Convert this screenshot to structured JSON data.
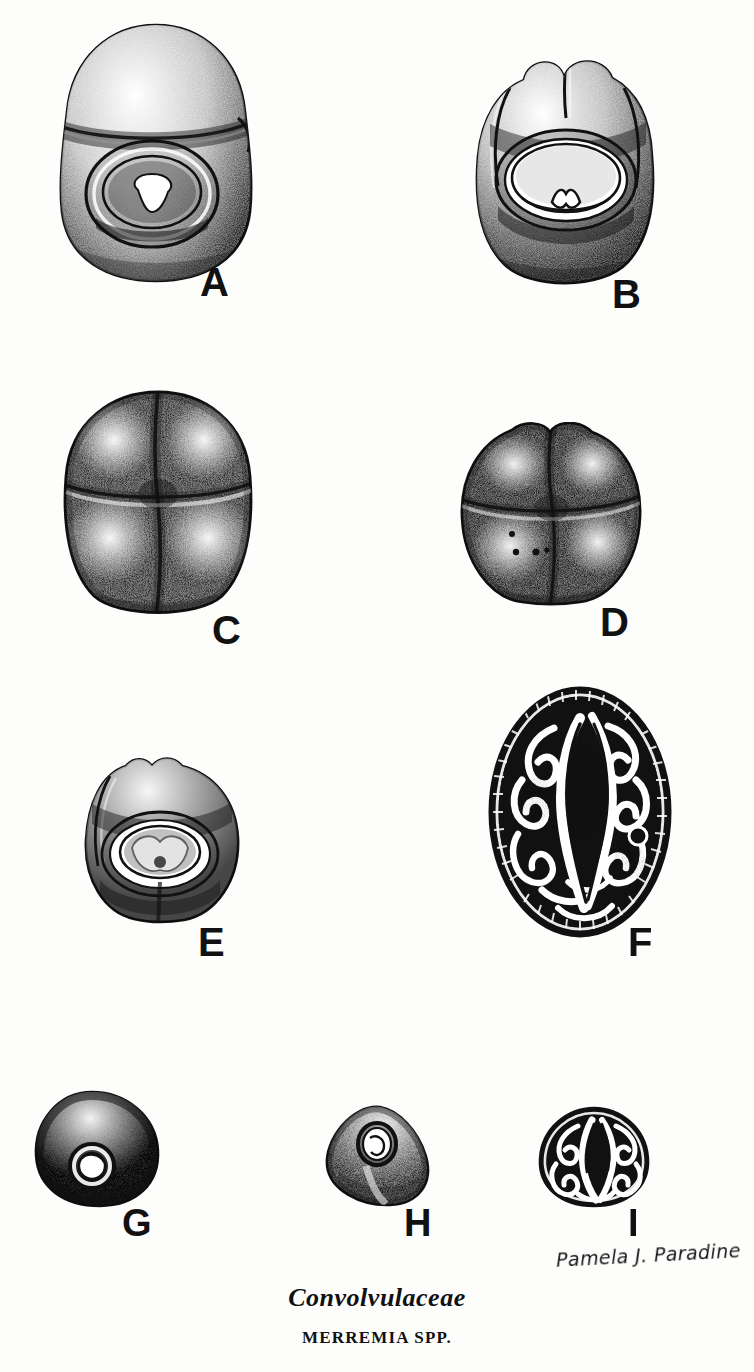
{
  "plate": {
    "title_family": "Convolvulaceae",
    "title_genus": "MERREMIA SPP.",
    "artist_signature": "Pamela J. Paradine",
    "ink_color": "#111111",
    "paper_color": "#fdfdfc",
    "figures": [
      {
        "letter": "A",
        "subject": "seed-hilar-view-large",
        "description": "Large ovoid seed, hilar (ventral) face showing broad oval hilum scar with concentric rim and pale central aperture; dense stipple shading",
        "x": 52,
        "y": 22,
        "w": 208,
        "h": 262,
        "label_x": 200,
        "label_y": 262,
        "label_size": 40
      },
      {
        "letter": "B",
        "subject": "seed-hilar-view-bilobed",
        "description": "Ovoid seed with bilobed apex, hilar face with large oval hilum and raised encircling rim",
        "x": 466,
        "y": 52,
        "w": 200,
        "h": 240,
        "label_x": 612,
        "label_y": 274,
        "label_size": 40
      },
      {
        "letter": "C",
        "subject": "seed-dorsal-view-four-lobed",
        "description": "Four-lobed seed, dorsal view with cruciform sutures dividing four convex lobes",
        "x": 58,
        "y": 388,
        "w": 200,
        "h": 232,
        "label_x": 212,
        "label_y": 610,
        "label_size": 40
      },
      {
        "letter": "D",
        "subject": "seed-dorsal-view-four-lobed-small",
        "description": "Smaller four-lobed seed, dorsal view with cruciform sutures and three dark punctate dots on lower-left lobe",
        "x": 452,
        "y": 422,
        "w": 198,
        "h": 186,
        "label_x": 600,
        "label_y": 602,
        "label_size": 40
      },
      {
        "letter": "E",
        "subject": "seed-hilar-view-small",
        "description": "Small broad seed, hilar face with nested oval rings around a stippled central hilum and basal raphe groove",
        "x": 74,
        "y": 752,
        "w": 176,
        "h": 176,
        "label_x": 198,
        "label_y": 922,
        "label_size": 40
      },
      {
        "letter": "F",
        "subject": "seed-cross-section-large",
        "description": "Transverse section of seed showing strongly convoluted folded cotyledons in high-contrast black and white, with textured testa rim",
        "x": 484,
        "y": 684,
        "w": 192,
        "h": 256,
        "label_x": 628,
        "label_y": 922,
        "label_size": 40
      },
      {
        "letter": "G",
        "subject": "seed-whole-dark-triangular",
        "description": "Small rounded-triangular dark seed with circular hilum ring near the base",
        "x": 30,
        "y": 1088,
        "w": 134,
        "h": 122,
        "label_x": 122,
        "label_y": 1204,
        "label_size": 38
      },
      {
        "letter": "H",
        "subject": "seed-whole-pale-triangular",
        "description": "Small pale triangular seed with oval ring-shaped hilum on upper face",
        "x": 322,
        "y": 1104,
        "w": 116,
        "h": 104,
        "label_x": 404,
        "label_y": 1204,
        "label_size": 38
      },
      {
        "letter": "I",
        "subject": "seed-cross-section-small",
        "description": "Small transverse section showing convoluted folded cotyledons, matching figure F",
        "x": 534,
        "y": 1106,
        "w": 120,
        "h": 102,
        "label_x": 628,
        "label_y": 1204,
        "label_size": 38
      }
    ],
    "caption": {
      "family_y": 1283,
      "family_size": 26,
      "genus_y": 1328,
      "genus_size": 17
    },
    "signature_pos": {
      "x": 556,
      "y": 1244
    }
  }
}
